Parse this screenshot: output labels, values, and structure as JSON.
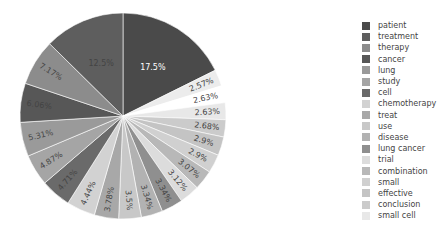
{
  "chart_data": {
    "type": "pie",
    "title": "",
    "labels": [
      "patient",
      "treatment",
      "therapy",
      "cancer",
      "lung",
      "study",
      "cell",
      "chemotherapy",
      "treat",
      "use",
      "disease",
      "lung cancer",
      "trial",
      "combination",
      "small",
      "effective",
      "conclusion",
      "small cell",
      "",
      ""
    ],
    "values": [
      17.5,
      12.5,
      7.17,
      6.06,
      5.31,
      4.87,
      4.71,
      4.44,
      3.78,
      3.5,
      3.34,
      3.34,
      3.12,
      3.07,
      2.9,
      2.9,
      2.68,
      2.63,
      2.63,
      2.57
    ],
    "value_labels": [
      "17.5%",
      "12.5%",
      "7.17%",
      "6.06%",
      "5.31%",
      "4.87%",
      "4.71%",
      "4.44%",
      "3.78%",
      "3.5%",
      "3.34%",
      "3.34%",
      "3.12%",
      "3.07%",
      "2.9%",
      "2.9%",
      "2.68%",
      "2.63%",
      "2.63%",
      "2.57%"
    ],
    "colors": [
      "#4a4a4a",
      "#5e5e5e",
      "#8c8c8c",
      "#575757",
      "#9a9a9a",
      "#a5a5a5",
      "#6a6a6a",
      "#d2d2d2",
      "#a8a8a8",
      "#c8c8c8",
      "#b2b2b2",
      "#8f8f8f",
      "#dcdcdc",
      "#b8b8b8",
      "#d0d0d0",
      "#c4c4c4",
      "#cbcbcb",
      "#e8e8e8",
      "#ffffff",
      "#ececec"
    ],
    "legend_position": "right",
    "direction": "clockwise-from-top (largest first, counter order)"
  },
  "legend": {
    "items": [
      "patient",
      "treatment",
      "therapy",
      "cancer",
      "lung",
      "study",
      "cell",
      "chemotherapy",
      "treat",
      "use",
      "disease",
      "lung cancer",
      "trial",
      "combination",
      "small",
      "effective",
      "conclusion",
      "small cell"
    ]
  }
}
